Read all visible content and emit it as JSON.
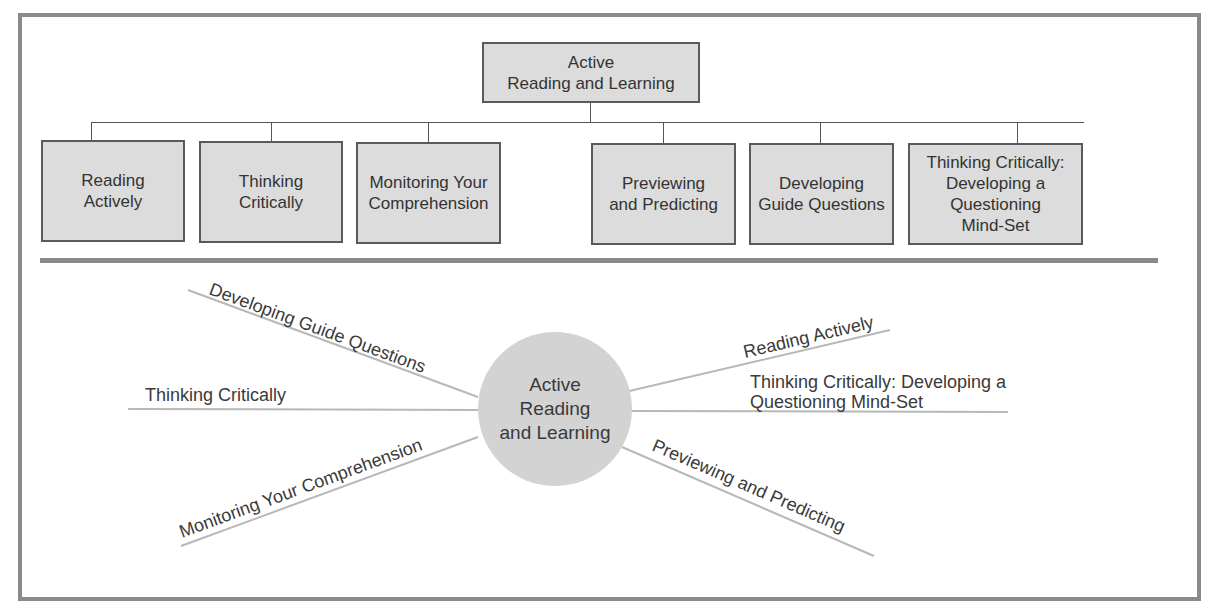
{
  "diagram": {
    "type": "concept-diagram",
    "hierarchy": {
      "root": {
        "line1": "Active",
        "line2": "Reading and Learning"
      },
      "children": [
        {
          "line1": "Reading",
          "line2": "Actively"
        },
        {
          "line1": "Thinking",
          "line2": "Critically"
        },
        {
          "line1": "Monitoring Your",
          "line2": "Comprehension"
        },
        {
          "line1": "Previewing",
          "line2": "and Predicting"
        },
        {
          "line1": "Developing",
          "line2": "Guide Questions"
        },
        {
          "line1": "Thinking Critically:",
          "line2": "Developing a",
          "line3": "Questioning",
          "line4": "Mind-Set"
        }
      ]
    },
    "map": {
      "center": {
        "line1": "Active",
        "line2": "Reading",
        "line3": "and Learning"
      },
      "spokes": [
        {
          "label": "Developing Guide Questions",
          "side": "left-upper"
        },
        {
          "label": "Thinking Critically",
          "side": "left-middle"
        },
        {
          "label": "Monitoring Your Comprehension",
          "side": "left-lower"
        },
        {
          "label": "Reading Actively",
          "side": "right-upper"
        },
        {
          "label": "Thinking Critically: Developing a",
          "label2": "Questioning Mind-Set",
          "side": "right-middle"
        },
        {
          "label": "Previewing and Predicting",
          "side": "right-lower"
        }
      ]
    },
    "colors": {
      "frame": "#8a8a8a",
      "box_fill": "#dcdcdc",
      "box_border": "#5a5a5a",
      "circle_fill": "#d3d3d3",
      "spoke_line": "#b8b8b8"
    }
  }
}
